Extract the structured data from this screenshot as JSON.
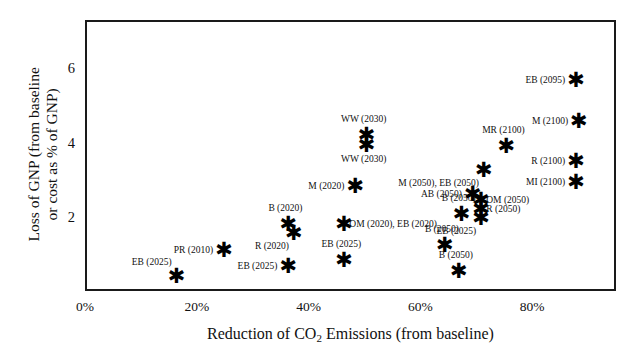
{
  "chart_data": {
    "type": "scatter",
    "title": "",
    "xlabel": "Reduction of CO2 Emissions (from baseline)",
    "xlabel_prefix": "Reduction of CO",
    "xlabel_sub": "2",
    "xlabel_suffix": " Emissions (from baseline)",
    "ylabel_line1": "Loss of GNP (from baseline",
    "ylabel_line2": "or cost as % of GNP)",
    "xlim": [
      0,
      95
    ],
    "ylim": [
      0,
      7.3
    ],
    "xticks": [
      "0%",
      "20%",
      "40%",
      "60%",
      "80%"
    ],
    "xtick_values": [
      0,
      20,
      40,
      60,
      80
    ],
    "yticks": [
      "2",
      "4",
      "6"
    ],
    "ytick_values": [
      2,
      4,
      6
    ],
    "grid": false,
    "legend": "none",
    "marker": "six-pointed-star",
    "marker_color": "#000000",
    "points": [
      {
        "label": "EB (2025)",
        "x": 15.5,
        "y": 0.45,
        "pos": "above-left"
      },
      {
        "label": "PR (2010)",
        "x": 24.0,
        "y": 1.15,
        "pos": "left"
      },
      {
        "label": "B (2020)",
        "x": 35.5,
        "y": 1.85,
        "pos": "above"
      },
      {
        "label": "R (2020)",
        "x": 36.5,
        "y": 1.62,
        "pos": "below-left"
      },
      {
        "label": "EB (2025)",
        "x": 35.5,
        "y": 0.72,
        "pos": "left"
      },
      {
        "label": "EB (2025)",
        "x": 45.5,
        "y": 0.88,
        "pos": "above"
      },
      {
        "label": "OM (2020), EB (2020)",
        "x": 45.5,
        "y": 1.86,
        "pos": "right"
      },
      {
        "label": "M (2020)",
        "x": 47.5,
        "y": 2.88,
        "pos": "left"
      },
      {
        "label": "WW (2030)",
        "x": 49.5,
        "y": 4.25,
        "pos": "above"
      },
      {
        "label": "WW (2030)",
        "x": 49.5,
        "y": 4.0,
        "pos": "below"
      },
      {
        "label": "B (2050)",
        "x": 63.5,
        "y": 1.28,
        "pos": "above"
      },
      {
        "label": "B (2050)",
        "x": 66.0,
        "y": 0.6,
        "pos": "above"
      },
      {
        "label": "B (2050)",
        "x": 66.5,
        "y": 2.12,
        "pos": "above"
      },
      {
        "label": "AB (2050)",
        "x": 68.5,
        "y": 2.68,
        "pos": "left"
      },
      {
        "label": "OM (2050)",
        "x": 70.0,
        "y": 2.5,
        "pos": "right"
      },
      {
        "label": "R (2050)",
        "x": 70.0,
        "y": 2.25,
        "pos": "right"
      },
      {
        "label": "EB (2025)",
        "x": 70.0,
        "y": 2.02,
        "pos": "below-left"
      },
      {
        "label": "M (2050), EB (2050)",
        "x": 70.5,
        "y": 3.3,
        "pos": "below-left"
      },
      {
        "label": "MR (2100)",
        "x": 74.5,
        "y": 3.95,
        "pos": "above"
      },
      {
        "label": "MI (2100)",
        "x": 87.0,
        "y": 2.98,
        "pos": "left"
      },
      {
        "label": "R (2100)",
        "x": 87.0,
        "y": 3.55,
        "pos": "left"
      },
      {
        "label": "M (2100)",
        "x": 87.5,
        "y": 4.62,
        "pos": "left"
      },
      {
        "label": "EB (2095)",
        "x": 87.0,
        "y": 5.75,
        "pos": "left"
      }
    ]
  }
}
